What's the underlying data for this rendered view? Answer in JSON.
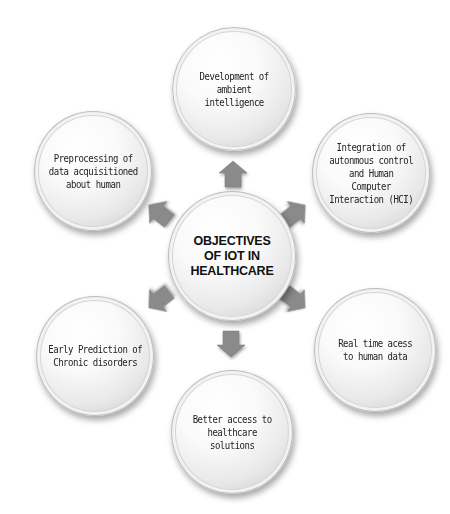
{
  "diagram": {
    "type": "radial-hub",
    "center": {
      "label": "OBJECTIVES\nOF IOT IN\nHEALTHCARE"
    },
    "objectives": [
      {
        "position": "top",
        "label": "Development  of\nambient\nintelligence"
      },
      {
        "position": "top-right",
        "label": "Integration of\nautonmous control\nand Human\nComputer\nInteraction (HCI)"
      },
      {
        "position": "bottom-right",
        "label": "Real time acess\nto human data"
      },
      {
        "position": "bottom",
        "label": "Better access to\nhealthcare\nsolutions"
      },
      {
        "position": "bottom-left",
        "label": "Early Prediction of\nChronic disorders"
      },
      {
        "position": "top-left",
        "label": "Preprocessing of\ndata acquisitioned\nabout human"
      }
    ],
    "arrow_color": "#8a8a8a",
    "icons": {
      "arrow": "block-arrow-icon"
    }
  }
}
